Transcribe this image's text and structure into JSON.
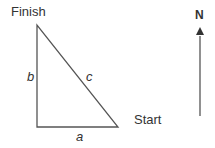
{
  "diagram": {
    "labels": {
      "finish": "Finish",
      "start": "Start",
      "side_a": "a",
      "side_b": "b",
      "side_c": "c",
      "north": "N"
    },
    "colors": {
      "line": "#555555",
      "text": "#333333"
    }
  }
}
